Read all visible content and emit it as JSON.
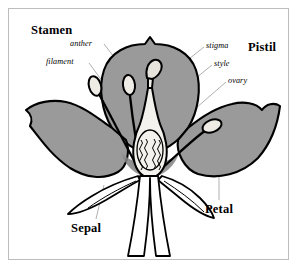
{
  "figure": {
    "border_color": "#bdbdbd",
    "background_color": "#ffffff"
  },
  "colors": {
    "petal_fill": "#9a9a9a",
    "petal_fill_shadow": "#8a8a8a",
    "outline": "#000000",
    "pistil_fill": "#f4f2ec",
    "sepal_fill": "#ffffff",
    "leader_line": "#8d8d8d",
    "label_text": "#000000"
  },
  "labels": {
    "major": [
      {
        "id": "stamen",
        "text": "Stamen"
      },
      {
        "id": "pistil",
        "text": "Pistil"
      },
      {
        "id": "petal",
        "text": "Petal"
      },
      {
        "id": "sepal",
        "text": "Sepal"
      }
    ],
    "minor": [
      {
        "id": "anther",
        "text": "anther"
      },
      {
        "id": "filament",
        "text": "filament"
      },
      {
        "id": "stigma",
        "text": "stigma"
      },
      {
        "id": "style",
        "text": "style"
      },
      {
        "id": "ovary",
        "text": "ovary"
      }
    ]
  },
  "parts": {
    "petals": [
      {
        "name": "upper-petal",
        "fill": "#9a9a9a"
      },
      {
        "name": "left-petal",
        "fill": "#9a9a9a"
      },
      {
        "name": "right-petal",
        "fill": "#9a9a9a"
      }
    ],
    "stamens": [
      {
        "name": "stamen-left-outer"
      },
      {
        "name": "stamen-left-inner"
      },
      {
        "name": "stamen-right"
      }
    ],
    "pistil": {
      "stigma": "curved club-shaped tip",
      "style": "narrow column",
      "ovary": "swollen base containing two rows of ovules",
      "ovule_rows": 2,
      "ovules_per_row": 6
    },
    "sepals": [
      {
        "name": "sepal-left"
      },
      {
        "name": "sepal-right"
      }
    ],
    "stem": {
      "name": "stem"
    }
  }
}
